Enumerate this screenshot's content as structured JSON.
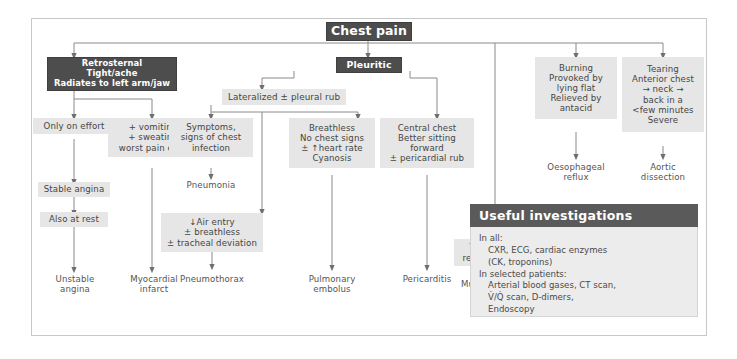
{
  "diagram": {
    "title": "Chest pain",
    "root": {
      "label": "Chest pain"
    },
    "branches": {
      "retrosternal": {
        "header": [
          "Retrosternal",
          "Tight/ache",
          "Radiates to left arm/jaw"
        ],
        "col_effort": {
          "step1": [
            "Only on effort"
          ],
          "step2": [
            "Stable angina"
          ],
          "step3": [
            "Also at rest"
          ],
          "outcome": [
            "Unstable",
            "angina"
          ]
        },
        "col_vomiting": {
          "step1": [
            "+ vomiting",
            "+ sweating",
            "worst pain ever"
          ],
          "outcome": [
            "Myocardial",
            "infarct"
          ]
        }
      },
      "pleuritic": {
        "header": [
          "Pleuritic"
        ],
        "lateralized": [
          "Lateralized ± pleural rub"
        ],
        "col_infection": {
          "step1": [
            "Symptoms,",
            "signs of chest",
            "infection"
          ],
          "outcome": [
            "Pneumonia"
          ]
        },
        "col_pneumothorax": {
          "step1": [
            "↓Air entry",
            "± breathless",
            "± tracheal deviation"
          ],
          "outcome": [
            "Pneumothorax"
          ]
        },
        "col_embolus": {
          "step1": [
            "Breathless",
            "No chest signs",
            "± ↑heart rate",
            "Cyanosis"
          ],
          "outcome": [
            "Pulmonary",
            "embolus"
          ]
        },
        "col_pericarditis": {
          "step1": [
            "Central chest",
            "Better sitting",
            "forward",
            "± pericardial rub"
          ],
          "outcome": [
            "Pericarditis"
          ]
        }
      },
      "musculoskeletal": {
        "step1": [
          "Tender spot",
          "replicates pain"
        ],
        "outcome": [
          "Musculoskeletal",
          "chest pain"
        ]
      },
      "burning": {
        "step1": [
          "Burning",
          "Provoked by",
          "lying flat",
          "Relieved by",
          "antacid"
        ],
        "outcome": [
          "Oesophageal",
          "reflux"
        ]
      },
      "tearing": {
        "step1": [
          "Tearing",
          "Anterior chest",
          "→ neck →",
          "back in a",
          "<few minutes",
          "Severe"
        ],
        "outcome": [
          "Aortic",
          "dissection"
        ]
      }
    }
  },
  "investigations": {
    "heading": "Useful investigations",
    "lines": [
      {
        "text": "In all:",
        "indent": false
      },
      {
        "text": "CXR, ECG, cardiac enzymes",
        "indent": true
      },
      {
        "text": "(CK, troponins)",
        "indent": true
      },
      {
        "text": "In selected patients:",
        "indent": false
      },
      {
        "text": "Arterial blood gases, CT scan,",
        "indent": true
      },
      {
        "text": "V̇/Q̇ scan, D-dimers,",
        "indent": true
      },
      {
        "text": "Endoscopy",
        "indent": true
      }
    ]
  },
  "colors": {
    "dark_box": "#4d4d4d",
    "grey_box": "#e6e6e6",
    "panel_head": "#5a5a5a",
    "panel_body": "#ececec",
    "line": "#8a8a8a",
    "frame": "#c8c8c8",
    "text_dark": "#454545",
    "text_light": "#ffffff"
  }
}
